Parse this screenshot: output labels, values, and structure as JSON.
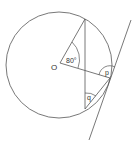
{
  "diagram": {
    "labels": {
      "center": "O",
      "angle_center": "80°",
      "angle_p": "p",
      "angle_q": "q"
    },
    "colors": {
      "stroke": "#555555",
      "background": "#ffffff"
    }
  }
}
